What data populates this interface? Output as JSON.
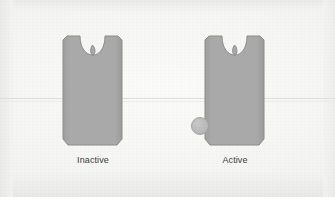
{
  "figure": {
    "title": "",
    "background_color": "#f4f4f2",
    "shape_fill": "#a8a8a8",
    "shape_stroke": "#8f8f8f",
    "ligand_fill": "#bdbdbd",
    "ligand_stroke": "#a0a0a0",
    "rule_line_color": "#dcdcd9",
    "panels": [
      {
        "id": "inactive",
        "label": "Inactive",
        "has_ligand": false,
        "ligand_name": "",
        "shape_name": "receptor-body"
      },
      {
        "id": "active",
        "label": "Active",
        "has_ligand": true,
        "ligand_name": "ligand",
        "shape_name": "receptor-body"
      }
    ]
  }
}
